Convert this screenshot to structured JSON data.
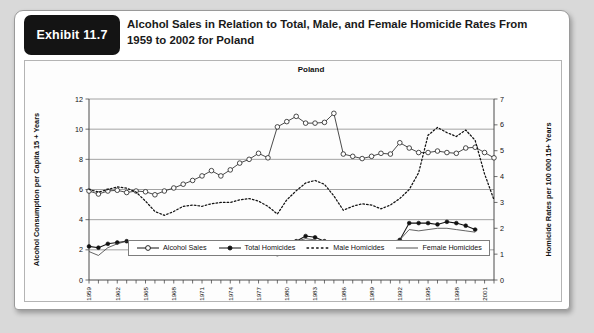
{
  "exhibit": {
    "badge_label": "Exhibit 11.7",
    "title": "Alcohol Sales in Relation to Total, Male, and Female Homicide Rates From 1959 to 2002 for Poland"
  },
  "chart_data": {
    "type": "line",
    "title": "Poland",
    "xlabel": "",
    "ylabel": "Alcohol Consumption per Capita 15 + Years",
    "y2label": "Homicide Rates per 100 000 15+ Years",
    "ylim": [
      0,
      12
    ],
    "y2lim": [
      0,
      7
    ],
    "yticks": [
      0,
      2,
      4,
      6,
      8,
      10,
      12
    ],
    "y2ticks": [
      0,
      1,
      2,
      3,
      4,
      5,
      6,
      7
    ],
    "grid": true,
    "legend_position": "bottom",
    "x": [
      1959,
      1960,
      1961,
      1962,
      1963,
      1964,
      1965,
      1966,
      1967,
      1968,
      1969,
      1970,
      1971,
      1972,
      1973,
      1974,
      1975,
      1976,
      1977,
      1978,
      1979,
      1980,
      1981,
      1982,
      1983,
      1984,
      1985,
      1986,
      1987,
      1988,
      1989,
      1990,
      1991,
      1992,
      1993,
      1994,
      1995,
      1996,
      1997,
      1998,
      1999,
      2000,
      2001,
      2002
    ],
    "xtick_labels": [
      "1959",
      "1962",
      "1965",
      "1968",
      "1971",
      "1974",
      "1977",
      "1980",
      "1983",
      "1986",
      "1989",
      "1992",
      "1995",
      "1998",
      "2001"
    ],
    "series": [
      {
        "name": "Alcohol Sales",
        "axis": "left",
        "marker": "open-circle",
        "style": "solid",
        "values": [
          5.9,
          5.7,
          5.9,
          5.95,
          5.8,
          5.9,
          5.85,
          5.65,
          5.9,
          6.1,
          6.35,
          6.6,
          6.9,
          7.25,
          6.9,
          7.3,
          7.75,
          8.0,
          8.4,
          8.1,
          10.15,
          10.5,
          10.85,
          10.4,
          10.4,
          10.45,
          11.05,
          8.35,
          8.2,
          8.05,
          8.2,
          8.4,
          8.35,
          9.1,
          8.75,
          8.45,
          8.45,
          8.55,
          8.45,
          8.4,
          8.75,
          8.8,
          8.45,
          8.1
        ]
      },
      {
        "name": "Total Homicides",
        "axis": "right",
        "marker": "filled-circle",
        "style": "solid",
        "values": [
          1.3,
          1.25,
          1.4,
          1.45,
          1.5,
          1.3,
          1.15,
          1.05,
          1.05,
          1.15,
          1.2,
          1.15,
          1.1,
          1.2,
          1.25,
          1.3,
          1.3,
          1.35,
          1.3,
          1.15,
          1.0,
          1.35,
          1.5,
          1.7,
          1.65,
          1.5,
          1.3,
          1.1,
          1.2,
          1.25,
          1.3,
          1.35,
          1.45,
          1.55,
          2.2,
          2.2,
          2.2,
          2.15,
          2.25,
          2.2,
          2.1,
          1.95,
          null,
          null
        ]
      },
      {
        "name": "Male Homicides",
        "axis": "right",
        "marker": "none",
        "style": "dotted",
        "values": [
          3.5,
          3.4,
          3.5,
          3.6,
          3.55,
          3.4,
          3.05,
          2.65,
          2.5,
          2.65,
          2.85,
          2.9,
          2.85,
          2.95,
          3.0,
          3.0,
          3.1,
          3.15,
          3.05,
          2.85,
          2.55,
          3.1,
          3.45,
          3.75,
          3.85,
          3.7,
          3.25,
          2.7,
          2.85,
          2.95,
          2.9,
          2.75,
          2.9,
          3.15,
          3.5,
          4.15,
          5.6,
          5.9,
          5.7,
          5.55,
          5.8,
          5.4,
          4.1,
          3.1
        ]
      },
      {
        "name": "Female Homicides",
        "axis": "right",
        "marker": "none",
        "style": "thin-solid",
        "values": [
          1.1,
          0.95,
          1.25,
          1.4,
          1.5,
          1.3,
          1.15,
          1.1,
          1.05,
          1.15,
          1.2,
          1.15,
          1.1,
          1.2,
          1.25,
          1.3,
          1.3,
          1.35,
          1.3,
          1.15,
          1.0,
          1.35,
          1.5,
          1.6,
          1.55,
          1.45,
          1.3,
          1.15,
          1.25,
          1.3,
          1.4,
          1.45,
          1.5,
          1.55,
          1.95,
          1.9,
          1.95,
          2.0,
          2.0,
          1.95,
          1.9,
          1.85,
          null,
          null
        ]
      }
    ],
    "legend": [
      {
        "label": "Alcohol Sales",
        "marker": "open-circle",
        "style": "solid"
      },
      {
        "label": "Total Homicides",
        "marker": "filled-circle",
        "style": "solid"
      },
      {
        "label": "Male Homicides",
        "marker": "none",
        "style": "dotted"
      },
      {
        "label": "Female Homicides",
        "marker": "none",
        "style": "thin-solid"
      }
    ]
  }
}
